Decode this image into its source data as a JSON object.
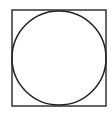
{
  "diagram": {
    "square": {
      "x": 12,
      "y": 10,
      "width": 94,
      "height": 96,
      "stroke": "#333333",
      "stroke_width": 1.5
    },
    "circle": {
      "cx": 59,
      "cy": 58,
      "r": 47,
      "stroke": "#222222",
      "stroke_width": 1.5
    },
    "background": "#ffffff"
  }
}
